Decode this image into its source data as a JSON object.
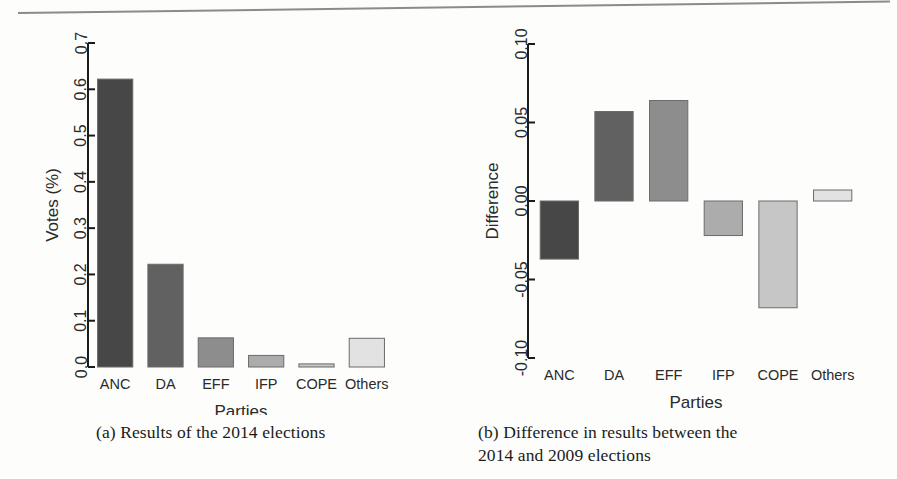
{
  "figure": {
    "rule_present": true
  },
  "captions": {
    "a": "(a) Results of the 2014 elections",
    "b_line1": "(b) Difference in results between the",
    "b_line2": "2014 and 2009 elections"
  },
  "colors": {
    "bar_anc": "#474747",
    "bar_da": "#616161",
    "bar_eff": "#8d8d8d",
    "bar_ifp": "#acacac",
    "bar_cope": "#c6c6c6",
    "bar_others": "#e2e2e2",
    "axis": "#1b1b1b",
    "text": "#2a2a2a",
    "bar_stroke": "#6b6b6b",
    "page_background": "#fdfdfc"
  },
  "chart_data": [
    {
      "id": "results-2014",
      "type": "bar",
      "title": "",
      "xlabel": "Parties",
      "ylabel": "Votes (%)",
      "categories": [
        "ANC",
        "DA",
        "EFF",
        "IFP",
        "COPE",
        "Others"
      ],
      "values": [
        0.622,
        0.222,
        0.063,
        0.025,
        0.0067,
        0.062
      ],
      "ylim": [
        0.0,
        0.7
      ],
      "yticks": [
        0.0,
        0.1,
        0.2,
        0.3,
        0.4,
        0.5,
        0.6,
        0.7
      ],
      "ytick_labels": [
        "0.0",
        "0.1",
        "0.2",
        "0.3",
        "0.4",
        "0.5",
        "0.6",
        "0.7"
      ],
      "grid": false,
      "legend": "none",
      "bar_colors": [
        "#474747",
        "#616161",
        "#8d8d8d",
        "#acacac",
        "#c6c6c6",
        "#e2e2e2"
      ]
    },
    {
      "id": "difference-2014-2009",
      "type": "bar",
      "title": "",
      "xlabel": "Parties",
      "ylabel": "Difference",
      "categories": [
        "ANC",
        "DA",
        "EFF",
        "IFP",
        "COPE",
        "Others"
      ],
      "values": [
        -0.037,
        0.057,
        0.064,
        -0.022,
        -0.068,
        0.007
      ],
      "ylim": [
        -0.1,
        0.1
      ],
      "yticks": [
        -0.1,
        -0.05,
        0.0,
        0.05,
        0.1
      ],
      "ytick_labels": [
        "-0.10",
        "-0.05",
        "0.00",
        "0.05",
        "0.10"
      ],
      "grid": false,
      "legend": "none",
      "bar_colors": [
        "#474747",
        "#616161",
        "#8d8d8d",
        "#acacac",
        "#c6c6c6",
        "#e2e2e2"
      ]
    }
  ]
}
